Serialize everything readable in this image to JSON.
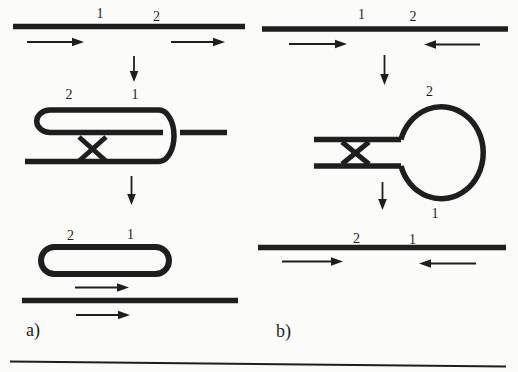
{
  "colors": {
    "ink": "#1e1e1e",
    "background": "#fbfbf9"
  },
  "panel_a": {
    "label": "a)",
    "parent_site_1": "1",
    "parent_site_2": "2",
    "foldback_site_2": "2",
    "foldback_site_1": "1",
    "excised_site_2": "2",
    "excised_site_1": "1"
  },
  "panel_b": {
    "label": "b)",
    "parent_site_1": "1",
    "parent_site_2": "2",
    "loop_site_2": "2",
    "loop_site_1": "1",
    "product_site_2": "2",
    "product_site_1": "1"
  }
}
